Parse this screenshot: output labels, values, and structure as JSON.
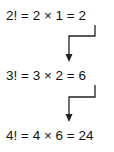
{
  "diagram": {
    "equations": [
      {
        "label": "2! = 2 × 1 = 2"
      },
      {
        "label": "3! = 3 × 2 = 6"
      },
      {
        "label": "4! = 4 × 6 = 24"
      }
    ],
    "arrows": [
      {
        "from": "result of 2!",
        "to": "second factor of 3!"
      },
      {
        "from": "result of 3!",
        "to": "second factor of 4!"
      }
    ],
    "colors": {
      "text": "#111111",
      "arrow": "#222222",
      "background": "#ffffff"
    }
  }
}
